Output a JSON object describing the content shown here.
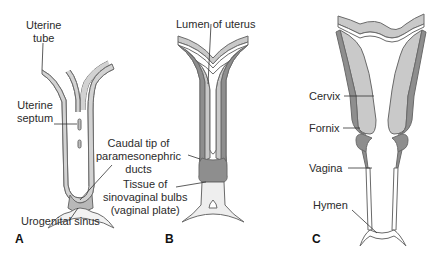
{
  "figure": {
    "colors": {
      "outline": "#6a6a6a",
      "wall_light": "#c9c9c9",
      "wall_dark": "#8e8e8e",
      "plate": "#eeeeee",
      "leader": "#333333"
    },
    "panels": [
      {
        "letter": "A",
        "labels": {
          "uterine_tube": [
            "Uterine",
            "tube"
          ],
          "uterine_septum": [
            "Uterine",
            "septum"
          ],
          "urogenital_sinus": "Urogenital sinus"
        }
      },
      {
        "letter": "B",
        "labels": {
          "lumen_of_uterus": "Lumen of uterus",
          "caudal_tip": [
            "Caudal tip of",
            "paramesonephric",
            "ducts"
          ],
          "sinovaginal_tissue": [
            "Tissue of",
            "sinovaginal bulbs",
            "(vaginal plate)"
          ]
        }
      },
      {
        "letter": "C",
        "labels": {
          "cervix": "Cervix",
          "fornix": "Fornix",
          "vagina": "Vagina",
          "hymen": "Hymen"
        }
      }
    ]
  }
}
